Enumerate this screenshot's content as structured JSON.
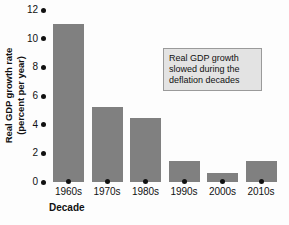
{
  "chart_data": {
    "type": "bar",
    "title": "",
    "xlabel": "Decade",
    "ylabel": "Real GDP growth rate (percent per year)",
    "ylabel_line1": "Real GDP growth rate",
    "ylabel_line2": "(percent per year)",
    "categories": [
      "1960s",
      "1970s",
      "1980s",
      "1990s",
      "2000s",
      "2010s"
    ],
    "values": [
      11.0,
      5.2,
      4.5,
      1.5,
      0.6,
      1.5
    ],
    "ylim": [
      0,
      12
    ],
    "yticks": [
      0,
      2,
      4,
      6,
      8,
      10,
      12
    ],
    "ytick_labels": [
      "0",
      "2",
      "4",
      "6",
      "8",
      "10",
      "12"
    ],
    "grid": false,
    "legend": null,
    "bar_color": "#808080",
    "annotations": [
      {
        "text": "Real GDP growth slowed during the deflation decades",
        "lines": [
          "Real GDP growth",
          "slowed during the",
          "deflation decades"
        ],
        "box_fill": "#e3e3e3",
        "box_border": "#9a9a9a"
      }
    ]
  }
}
